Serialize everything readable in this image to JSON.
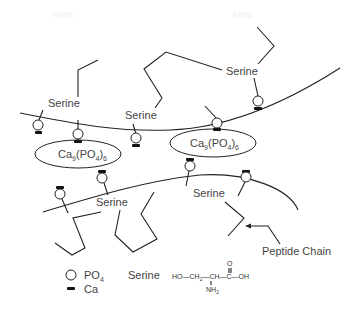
{
  "diagram": {
    "watermarks": [
      "ASRI",
      "ASRI"
    ],
    "serine_labels": [
      "Serine",
      "Serine",
      "Serine",
      "Serine",
      "Serine"
    ],
    "complexes": [
      {
        "prefix": "Ca",
        "sub1": "9",
        "mid": "(PO",
        "sub2": "4",
        "end": ")",
        "sub3": "6"
      },
      {
        "prefix": "Ca",
        "sub1": "9",
        "mid": "(PO",
        "sub2": "4",
        "end": ")",
        "sub3": "6"
      }
    ],
    "peptide_chain_label": "Peptide Chain"
  },
  "legend": {
    "po4_label": "PO",
    "po4_sub": "4",
    "ca_label": "Ca",
    "serine_label": "Serine",
    "serine_formula": {
      "main": "HO—CH",
      "sub": "2",
      "rest": "—CH—C—OH",
      "top": "O",
      "bottom": "NH",
      "bottom_sub": "2"
    }
  },
  "colors": {
    "line": "#222222",
    "text": "#444444",
    "background": "#ffffff"
  }
}
